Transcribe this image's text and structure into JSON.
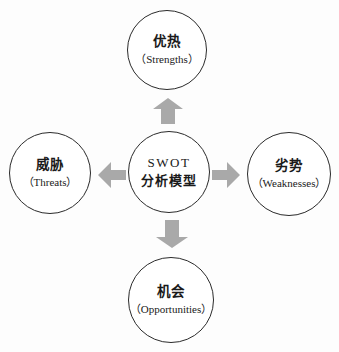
{
  "diagram_title": "SWOT analysis model diagram",
  "colors": {
    "background": "#fdfdfd",
    "circle_fill": "#ffffff",
    "circle_border": "#2b2b2b",
    "arrow_fill": "#a9a9a9",
    "text": "#1a1a1a"
  },
  "center": {
    "line1": "SWOT",
    "line2": "分析模型"
  },
  "nodes": {
    "top": {
      "zh": "优热",
      "en": "（Strengths）"
    },
    "right": {
      "zh": "劣势",
      "en": "（Weaknesses）"
    },
    "bottom": {
      "zh": "机会",
      "en": "（Opportunities）"
    },
    "left": {
      "zh": "威胁",
      "en": "（Threats）"
    }
  },
  "icons": {
    "up": "arrow-up-icon",
    "down": "arrow-down-icon",
    "left": "arrow-left-icon",
    "right": "arrow-right-icon"
  }
}
